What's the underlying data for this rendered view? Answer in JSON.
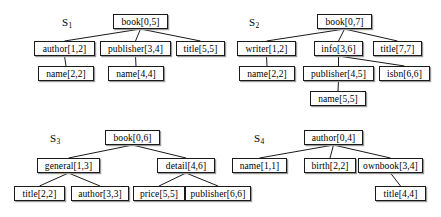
{
  "figure": {
    "caption_labels": [
      "S1",
      "S2",
      "S3",
      "S4"
    ],
    "trees": [
      {
        "id": "S1",
        "label_base": "S",
        "label_sub": "1",
        "label_x": 62,
        "label_y": 16,
        "nodes": [
          {
            "key": "s1-book",
            "text": "book[0,5]",
            "x": 113,
            "y": 14,
            "w": 55,
            "h": 15
          },
          {
            "key": "s1-author",
            "text": "author[1,2]",
            "x": 34,
            "y": 41,
            "w": 61,
            "h": 15
          },
          {
            "key": "s1-publisher",
            "text": "publisher[3,4]",
            "x": 100,
            "y": 41,
            "w": 71,
            "h": 15
          },
          {
            "key": "s1-title",
            "text": "title[5,5]",
            "x": 176,
            "y": 41,
            "w": 49,
            "h": 15
          },
          {
            "key": "s1-name2",
            "text": "name[2,2]",
            "x": 38,
            "y": 66,
            "w": 56,
            "h": 15
          },
          {
            "key": "s1-name4",
            "text": "name[4,4]",
            "x": 108,
            "y": 66,
            "w": 56,
            "h": 15
          }
        ],
        "edges": [
          {
            "from": "s1-book",
            "to": "s1-author"
          },
          {
            "from": "s1-book",
            "to": "s1-publisher"
          },
          {
            "from": "s1-book",
            "to": "s1-title"
          },
          {
            "from": "s1-author",
            "to": "s1-name2"
          },
          {
            "from": "s1-publisher",
            "to": "s1-name4"
          }
        ]
      },
      {
        "id": "S2",
        "label_base": "S",
        "label_sub": "2",
        "label_x": 249,
        "label_y": 16,
        "nodes": [
          {
            "key": "s2-book",
            "text": "book[0,7]",
            "x": 317,
            "y": 14,
            "w": 55,
            "h": 15
          },
          {
            "key": "s2-writer",
            "text": "writer[1,2]",
            "x": 237,
            "y": 41,
            "w": 59,
            "h": 15
          },
          {
            "key": "s2-info",
            "text": "info[3,6]",
            "x": 314,
            "y": 41,
            "w": 49,
            "h": 15
          },
          {
            "key": "s2-title",
            "text": "title[7,7]",
            "x": 373,
            "y": 41,
            "w": 49,
            "h": 15
          },
          {
            "key": "s2-name2",
            "text": "name[2,2]",
            "x": 239,
            "y": 66,
            "w": 56,
            "h": 15
          },
          {
            "key": "s2-publisher",
            "text": "publisher[4,5]",
            "x": 303,
            "y": 66,
            "w": 71,
            "h": 15
          },
          {
            "key": "s2-isbn",
            "text": "isbn[6,6]",
            "x": 379,
            "y": 66,
            "w": 51,
            "h": 15
          },
          {
            "key": "s2-name5",
            "text": "name[5,5]",
            "x": 310,
            "y": 91,
            "w": 56,
            "h": 15
          }
        ],
        "edges": [
          {
            "from": "s2-book",
            "to": "s2-writer"
          },
          {
            "from": "s2-book",
            "to": "s2-info"
          },
          {
            "from": "s2-book",
            "to": "s2-title"
          },
          {
            "from": "s2-writer",
            "to": "s2-name2"
          },
          {
            "from": "s2-info",
            "to": "s2-publisher"
          },
          {
            "from": "s2-info",
            "to": "s2-isbn"
          },
          {
            "from": "s2-publisher",
            "to": "s2-name5"
          }
        ]
      },
      {
        "id": "S3",
        "label_base": "S",
        "label_sub": "3",
        "label_x": 50,
        "label_y": 132,
        "nodes": [
          {
            "key": "s3-book",
            "text": "book[0,6]",
            "x": 105,
            "y": 130,
            "w": 55,
            "h": 15
          },
          {
            "key": "s3-general",
            "text": "general[1,3]",
            "x": 37,
            "y": 158,
            "w": 63,
            "h": 15
          },
          {
            "key": "s3-detail",
            "text": "detail[4,6]",
            "x": 157,
            "y": 158,
            "w": 58,
            "h": 15
          },
          {
            "key": "s3-title",
            "text": "title[2,2]",
            "x": 14,
            "y": 186,
            "w": 51,
            "h": 15
          },
          {
            "key": "s3-author",
            "text": "author[3,3]",
            "x": 71,
            "y": 186,
            "w": 58,
            "h": 15
          },
          {
            "key": "s3-price",
            "text": "price[5,5]",
            "x": 133,
            "y": 186,
            "w": 52,
            "h": 15
          },
          {
            "key": "s3-publisher",
            "text": "publisher[6,6]",
            "x": 185,
            "y": 186,
            "w": 66,
            "h": 15
          }
        ],
        "edges": [
          {
            "from": "s3-book",
            "to": "s3-general"
          },
          {
            "from": "s3-book",
            "to": "s3-detail"
          },
          {
            "from": "s3-general",
            "to": "s3-title"
          },
          {
            "from": "s3-general",
            "to": "s3-author"
          },
          {
            "from": "s3-detail",
            "to": "s3-price"
          },
          {
            "from": "s3-detail",
            "to": "s3-publisher"
          }
        ]
      },
      {
        "id": "S4",
        "label_base": "S",
        "label_sub": "4",
        "label_x": 254,
        "label_y": 132,
        "nodes": [
          {
            "key": "s4-author",
            "text": "author[0,4]",
            "x": 304,
            "y": 130,
            "w": 59,
            "h": 15
          },
          {
            "key": "s4-name",
            "text": "name[1,1]",
            "x": 232,
            "y": 158,
            "w": 55,
            "h": 15
          },
          {
            "key": "s4-birth",
            "text": "birth[2,2]",
            "x": 304,
            "y": 158,
            "w": 52,
            "h": 15
          },
          {
            "key": "s4-ownbook",
            "text": "ownbook[3,4]",
            "x": 358,
            "y": 158,
            "w": 65,
            "h": 15
          },
          {
            "key": "s4-title",
            "text": "title[4,4]",
            "x": 375,
            "y": 186,
            "w": 51,
            "h": 15
          }
        ],
        "edges": [
          {
            "from": "s4-author",
            "to": "s4-name"
          },
          {
            "from": "s4-author",
            "to": "s4-birth"
          },
          {
            "from": "s4-author",
            "to": "s4-ownbook"
          },
          {
            "from": "s4-ownbook",
            "to": "s4-title"
          }
        ]
      }
    ]
  }
}
